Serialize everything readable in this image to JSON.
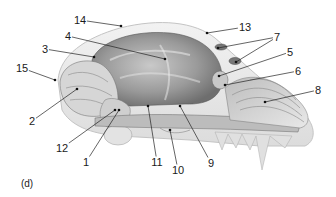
{
  "figure": {
    "panel_label": "(d)",
    "labels": [
      {
        "text": "14",
        "tx": 80,
        "ty": 20,
        "dots": [
          [
            121,
            26
          ]
        ]
      },
      {
        "text": "13",
        "tx": 245,
        "ty": 27,
        "dots": [
          [
            207,
            33
          ]
        ]
      },
      {
        "text": "4",
        "tx": 68,
        "ty": 36,
        "dots": [
          [
            165,
            59
          ]
        ]
      },
      {
        "text": "7",
        "tx": 277,
        "ty": 37,
        "dots": [
          [
            218,
            48
          ],
          [
            236,
            62
          ]
        ]
      },
      {
        "text": "3",
        "tx": 45,
        "ty": 49,
        "dots": [
          [
            94,
            57
          ]
        ]
      },
      {
        "text": "5",
        "tx": 290,
        "ty": 52,
        "dots": [
          [
            219,
            76
          ]
        ]
      },
      {
        "text": "15",
        "tx": 22,
        "ty": 68,
        "dots": [
          [
            55,
            80
          ]
        ]
      },
      {
        "text": "6",
        "tx": 298,
        "ty": 71,
        "dots": [
          [
            225,
            85
          ]
        ]
      },
      {
        "text": "8",
        "tx": 318,
        "ty": 90,
        "dots": [
          [
            265,
            102
          ]
        ]
      },
      {
        "text": "2",
        "tx": 32,
        "ty": 121,
        "dots": [
          [
            77,
            89
          ]
        ]
      },
      {
        "text": "12",
        "tx": 62,
        "ty": 148,
        "dots": [
          [
            115,
            110
          ]
        ]
      },
      {
        "text": "1",
        "tx": 86,
        "ty": 162,
        "dots": [
          [
            119,
            110
          ]
        ]
      },
      {
        "text": "11",
        "tx": 157,
        "ty": 162,
        "dots": [
          [
            148,
            106
          ]
        ]
      },
      {
        "text": "10",
        "tx": 178,
        "ty": 170,
        "dots": [
          [
            170,
            130
          ]
        ]
      },
      {
        "text": "9",
        "tx": 211,
        "ty": 163,
        "dots": [
          [
            180,
            106
          ]
        ]
      }
    ]
  }
}
